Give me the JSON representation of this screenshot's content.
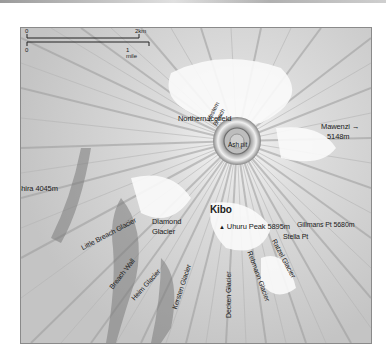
{
  "map": {
    "title": "Kibo summit map",
    "scale": {
      "km_start": "0",
      "km_end": "2km",
      "mile_start": "0",
      "mile_end": "1 mile"
    },
    "labels": {
      "northern_icefield": "Northern Icefield",
      "mawenzi": "Mawenzi →",
      "mawenzi_alt": "5148m",
      "shira": "← Shira 4045m",
      "western_breach_1": "Western",
      "western_breach_2": "Breach",
      "ash_pit": "Ash pit",
      "kibo": "Kibo",
      "uhuru_peak": "Uhuru Peak 5895m",
      "gillmans_pt": "Gillmans Pt 5680m",
      "stella_pt": "Stella Pt",
      "little_breach_glacier": "Little Breach Glacier",
      "diamond_glacier_1": "Diamond",
      "diamond_glacier_2": "Glacier",
      "breach_wall": "Breach Wall",
      "heim_glacier": "Heim Glacier",
      "kersten_glacier": "Kersten Glacier",
      "decken_glacier": "Decken Glacier",
      "rebmann_glacier": "Rebmann Glacier",
      "ratzel_glacier": "Ratzel Glacier"
    },
    "colors": {
      "background": "#ffffff",
      "terrain_light": "#f2f2f2",
      "terrain_mid": "#bdbdbd",
      "terrain_dark": "#7a7a7a",
      "frame": "#8a8a8a",
      "text": "#1a1a1a"
    }
  }
}
